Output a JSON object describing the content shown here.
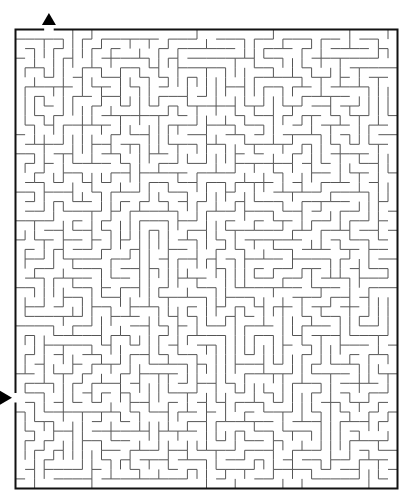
{
  "puzzle": {
    "type": "maze",
    "title": "",
    "grid": {
      "cols": 40,
      "rows": 48,
      "seed": 20240611
    },
    "frame": {
      "left": 15.5,
      "top": 29.5,
      "right": 397.5,
      "bottom": 488.5
    },
    "entry": {
      "side": "top",
      "col": 3,
      "arrow": "up-triangle"
    },
    "exit": {
      "side": "left",
      "row": 38,
      "arrow": "right-triangle"
    },
    "colors": {
      "wall": "#555555",
      "frame": "#111111",
      "arrow": "#000000",
      "background": "#ffffff"
    }
  }
}
